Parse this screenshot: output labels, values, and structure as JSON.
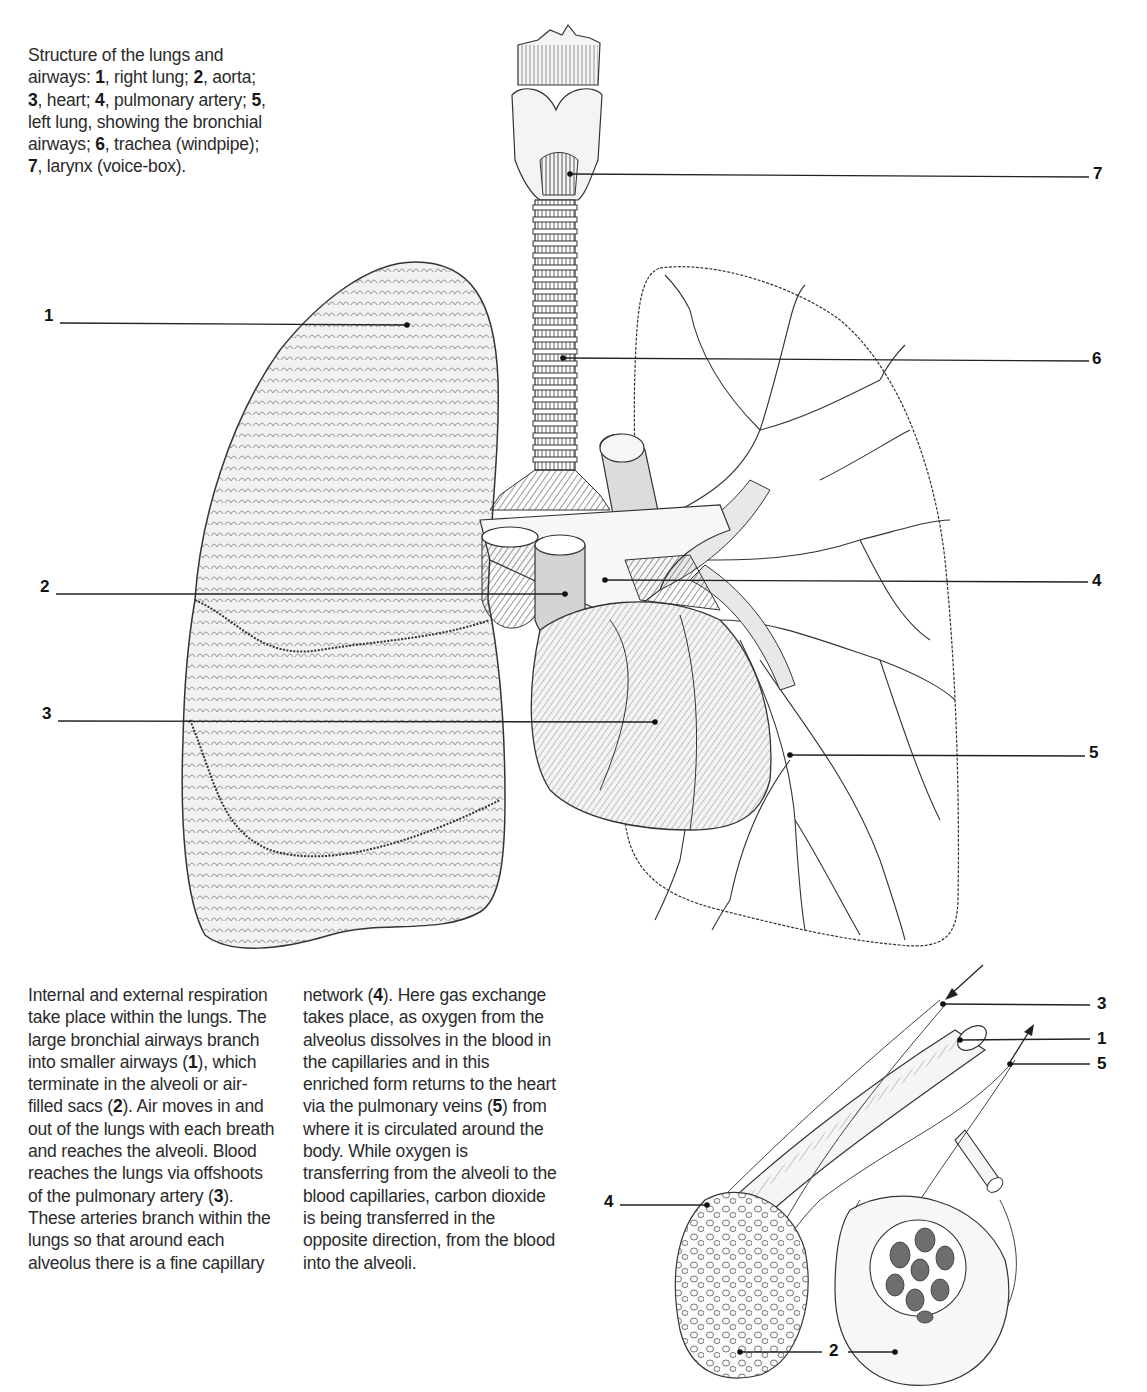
{
  "main_figure": {
    "caption_segments": [
      {
        "t": "Structure of the lungs and airways: "
      },
      {
        "t": "1",
        "b": true
      },
      {
        "t": ", right lung; "
      },
      {
        "t": "2",
        "b": true
      },
      {
        "t": ", aorta; "
      },
      {
        "t": "3",
        "b": true
      },
      {
        "t": ", heart; "
      },
      {
        "t": "4",
        "b": true
      },
      {
        "t": ", pulmonary artery; "
      },
      {
        "t": "5",
        "b": true
      },
      {
        "t": ", left lung, showing the bronchial airways; "
      },
      {
        "t": "6",
        "b": true
      },
      {
        "t": ", trachea (windpipe); "
      },
      {
        "t": "7",
        "b": true
      },
      {
        "t": ", larynx (voice-box)."
      }
    ],
    "labels": [
      {
        "num": "1",
        "name": "right lung",
        "x": 44,
        "y": 307,
        "line_from": [
          60,
          323
        ],
        "line_to": [
          407,
          323
        ]
      },
      {
        "num": "2",
        "name": "aorta",
        "x": 40,
        "y": 578,
        "line_from": [
          56,
          594
        ],
        "line_to": [
          565,
          594
        ]
      },
      {
        "num": "3",
        "name": "heart",
        "x": 42,
        "y": 706,
        "line_from": [
          58,
          721
        ],
        "line_to": [
          655,
          721
        ]
      },
      {
        "num": "4",
        "name": "pulmonary artery",
        "x": 1091,
        "y": 571,
        "line_from": [
          605,
          580
        ],
        "line_to": [
          1088,
          580
        ]
      },
      {
        "num": "5",
        "name": "left lung",
        "x": 1088,
        "y": 742,
        "line_from": [
          790,
          756
        ],
        "line_to": [
          1085,
          756
        ]
      },
      {
        "num": "6",
        "name": "trachea",
        "x": 1092,
        "y": 348,
        "line_from": [
          563,
          358
        ],
        "line_to": [
          1089,
          358
        ]
      },
      {
        "num": "7",
        "name": "larynx",
        "x": 1092,
        "y": 163,
        "line_from": [
          580,
          175
        ],
        "line_to": [
          1089,
          177
        ]
      }
    ]
  },
  "body_text": {
    "column1_segments": [
      {
        "t": "Internal and external respiration take place within the lungs. The large bronchial airways branch into smaller airways ("
      },
      {
        "t": "1",
        "b": true
      },
      {
        "t": "), which terminate in the alveoli or air-filled sacs ("
      },
      {
        "t": "2",
        "b": true
      },
      {
        "t": "). Air moves in and out of the lungs with each breath and reaches the alveoli. Blood reaches the lungs via offshoots of the pulmonary artery ("
      },
      {
        "t": "3",
        "b": true
      },
      {
        "t": "). These arteries branch within the lungs so that around each alveolus there is a fine capillary"
      }
    ],
    "column2_segments": [
      {
        "t": "network ("
      },
      {
        "t": "4",
        "b": true
      },
      {
        "t": "). Here gas exchange takes place, as oxygen from the alveolus dissolves in the blood in the capillaries and in this enriched form returns to the heart via the pulmonary veins ("
      },
      {
        "t": "5",
        "b": true
      },
      {
        "t": ") from where it is circulated around the body. While oxygen is transferring from the alveoli to the blood capillaries, carbon dioxide is being transferred in the opposite direction, from the blood into the alveoli."
      }
    ]
  },
  "alveoli_figure": {
    "labels": [
      {
        "num": "3",
        "name": "pulmonary artery offshoot",
        "x": 1097,
        "y": 996
      },
      {
        "num": "1",
        "name": "smaller airway",
        "x": 1097,
        "y": 1022
      },
      {
        "num": "5",
        "name": "pulmonary vein",
        "x": 1097,
        "y": 1048
      },
      {
        "num": "4",
        "name": "capillary network",
        "x": 604,
        "y": 1190
      },
      {
        "num": "2",
        "name": "alveoli",
        "x": 829,
        "y": 1342
      }
    ]
  },
  "colors": {
    "ink": "#1a1a1a",
    "text": "#2b2b2b",
    "shade": "#c8c8c8",
    "background": "#ffffff"
  }
}
